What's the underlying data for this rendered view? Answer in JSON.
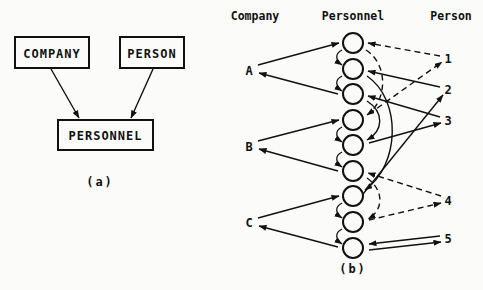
{
  "panel_a": {
    "caption": "(a)",
    "entities": [
      {
        "id": "company",
        "label": "COMPANY",
        "x": 15,
        "y": 37,
        "w": 74,
        "h": 31
      },
      {
        "id": "person",
        "label": "PERSON",
        "x": 120,
        "y": 37,
        "w": 64,
        "h": 31
      },
      {
        "id": "personnel",
        "label": "PERSONNEL",
        "x": 58,
        "y": 120,
        "w": 95,
        "h": 30
      }
    ],
    "relationships": [
      {
        "from": "company",
        "to": "personnel"
      },
      {
        "from": "person",
        "to": "personnel"
      }
    ]
  },
  "panel_b": {
    "caption": "(b)",
    "headers": {
      "company": "Company",
      "personnel": "Personnel",
      "person": "Person"
    },
    "companies": [
      {
        "label": "A",
        "y": 70
      },
      {
        "label": "B",
        "y": 146
      },
      {
        "label": "C",
        "y": 222
      }
    ],
    "persons": [
      {
        "label": "1",
        "y": 58
      },
      {
        "label": "2",
        "y": 89
      },
      {
        "label": "3",
        "y": 120
      },
      {
        "label": "4",
        "y": 200
      },
      {
        "label": "5",
        "y": 238
      }
    ],
    "personnel_records": 9,
    "legend_note": "solid = person chain, dashed = person chain (alternate)"
  }
}
